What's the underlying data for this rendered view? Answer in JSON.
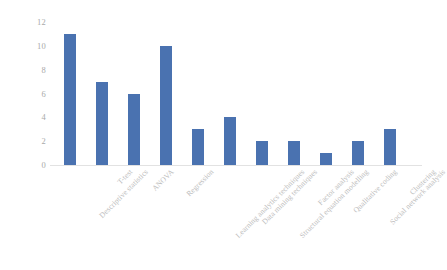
{
  "chart_data": {
    "type": "bar",
    "title": "",
    "subtitle": "",
    "xlabel": "",
    "ylabel": "",
    "ylim": [
      0,
      12
    ],
    "yticks": [
      0,
      2,
      4,
      6,
      8,
      10,
      12
    ],
    "grid": false,
    "legend": false,
    "legend_position": "none",
    "bar_color": "#4a72b0",
    "tick_label_color": "#a9a9a9",
    "category_label_color": "#bcbcbc",
    "category_label_rotation": -45,
    "categories": [
      "Descriptive statistics",
      "T-test",
      "ANOVA",
      "Regression",
      "Learning analytics techniques",
      "Data mining techniques",
      "Structural equation modelling",
      "Factor analysis",
      "Qualitative coding",
      "Social network analysis",
      "Clustering"
    ],
    "values": [
      11,
      7,
      6,
      10,
      3,
      4,
      2,
      2,
      1,
      2,
      3
    ]
  }
}
